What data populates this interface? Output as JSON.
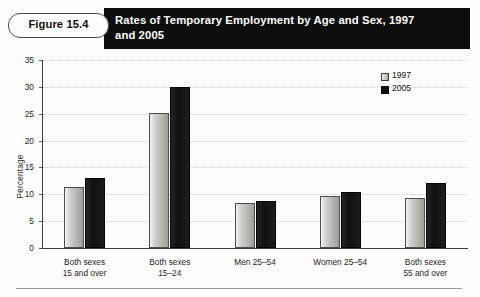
{
  "figure": {
    "tag": "Figure 15.4",
    "title": "Rates of Temporary Employment by Age and Sex, 1997 and 2005"
  },
  "legend": {
    "entries": [
      {
        "label": "1997",
        "color": "#c3c3bf",
        "icon": "legend-swatch-1997"
      },
      {
        "label": "2005",
        "color": "#101010",
        "icon": "legend-swatch-2005"
      }
    ]
  },
  "chart_data": {
    "type": "bar",
    "title": "Rates of Temporary Employment by Age and Sex, 1997 and 2005",
    "xlabel": "",
    "ylabel": "Percentage",
    "ylim": [
      0,
      35
    ],
    "yticks": [
      0,
      5,
      10,
      15,
      20,
      25,
      30,
      35
    ],
    "ytick_labels": [
      "0",
      "5",
      "10",
      "15",
      "20",
      "25",
      "30",
      "35"
    ],
    "grid": true,
    "legend_position": "top-right",
    "categories": [
      "Both sexes 15 and over",
      "Both sexes 15–24",
      "Men 25–54",
      "Women 25–54",
      "Both sexes 55 and over"
    ],
    "category_lines": [
      [
        "Both sexes",
        "15 and over"
      ],
      [
        "Both sexes",
        "15–24"
      ],
      [
        "Men 25–54",
        ""
      ],
      [
        "Women 25–54",
        ""
      ],
      [
        "Both sexes",
        "55 and over"
      ]
    ],
    "series": [
      {
        "name": "1997",
        "values": [
          11.4,
          25.2,
          8.3,
          9.7,
          9.3
        ]
      },
      {
        "name": "2005",
        "values": [
          13.0,
          30.0,
          8.8,
          10.5,
          12.1
        ]
      }
    ]
  }
}
